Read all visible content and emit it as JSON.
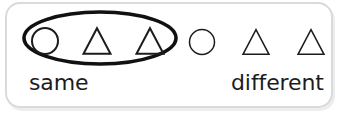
{
  "figure": {
    "kind": "same-different-grouping-diagram",
    "card": {
      "background_color": "#ffffff",
      "border_color": "#d9dadc",
      "corner_radius": 15
    },
    "grouping_ellipse": {
      "name": "same-group-ellipse",
      "stroke_color": "#111111",
      "stroke_width": 3.6,
      "center_x": 100,
      "center_y": 38,
      "radius_x": 76,
      "radius_y": 26
    },
    "shape_stroke_color": "#1c1c1e",
    "groups": [
      {
        "id": "same",
        "label": "same",
        "enclosed": true,
        "shapes": [
          {
            "type": "circle",
            "name": "circle",
            "cx": 45,
            "cy": 41,
            "r": 13,
            "stroke_width": 2.0
          },
          {
            "type": "triangle",
            "name": "triangle",
            "cx": 97,
            "cy": 41,
            "size": 27,
            "stroke_width": 2.0
          },
          {
            "type": "triangle",
            "name": "triangle",
            "cx": 150,
            "cy": 41,
            "size": 27,
            "stroke_width": 2.0
          }
        ]
      },
      {
        "id": "different",
        "label": "different",
        "enclosed": false,
        "shapes": [
          {
            "type": "circle",
            "name": "circle",
            "cx": 202,
            "cy": 42,
            "r": 12.5,
            "stroke_width": 1.5
          },
          {
            "type": "triangle",
            "name": "triangle",
            "cx": 256,
            "cy": 42,
            "size": 26,
            "stroke_width": 1.5
          },
          {
            "type": "triangle",
            "name": "triangle",
            "cx": 311,
            "cy": 42,
            "size": 26,
            "stroke_width": 1.5
          }
        ]
      }
    ],
    "labels": {
      "same": "same",
      "different": "different",
      "text_color": "#1c1c1e",
      "font_size_px": 22
    }
  }
}
